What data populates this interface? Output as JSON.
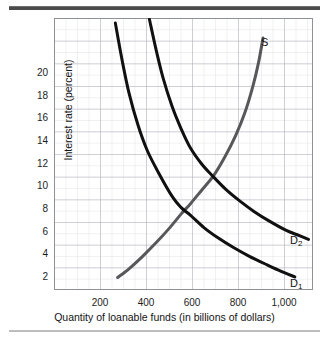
{
  "chart_data": {
    "type": "line",
    "title": "",
    "xlabel": "Quantity of loanable funds (in billions of dollars)",
    "ylabel": "Interest rate (percent)",
    "xlim": [
      0,
      1140
    ],
    "ylim": [
      0,
      21.8
    ],
    "grid": true,
    "grid_major_x": 200,
    "grid_minor_x": 50,
    "grid_major_y": 2,
    "grid_minor_y": 1,
    "legend": "inline-curve-labels",
    "xticks": [
      200,
      400,
      600,
      800,
      1000
    ],
    "xtick_labels": [
      "200",
      "400",
      "600",
      "800",
      "1,000"
    ],
    "yticks": [
      2,
      4,
      6,
      8,
      10,
      12,
      14,
      16,
      18,
      20
    ],
    "ytick_labels": [
      "2",
      "4",
      "6",
      "8",
      "10",
      "12",
      "14",
      "16",
      "18",
      "20"
    ],
    "series": [
      {
        "name": "S",
        "label": "S",
        "role": "supply",
        "color": "#58585a",
        "width": 3,
        "points": [
          [
            280,
            1.0
          ],
          [
            330,
            1.7
          ],
          [
            390,
            2.7
          ],
          [
            450,
            3.8
          ],
          [
            510,
            5.0
          ],
          [
            560,
            6.1
          ],
          [
            600,
            6.9
          ],
          [
            650,
            8.0
          ],
          [
            700,
            9.1
          ],
          [
            750,
            10.6
          ],
          [
            800,
            12.4
          ],
          [
            840,
            14.2
          ],
          [
            875,
            16.3
          ],
          [
            900,
            18.2
          ],
          [
            920,
            20.2
          ]
        ]
      },
      {
        "name": "D1",
        "label": "D",
        "sublabel": "1",
        "role": "demand-original",
        "color": "#101010",
        "width": 3,
        "points": [
          [
            270,
            21.4
          ],
          [
            300,
            18.4
          ],
          [
            330,
            15.8
          ],
          [
            370,
            13.2
          ],
          [
            410,
            11.2
          ],
          [
            460,
            9.4
          ],
          [
            520,
            7.5
          ],
          [
            560,
            6.6
          ],
          [
            600,
            6.0
          ],
          [
            660,
            5.0
          ],
          [
            720,
            4.2
          ],
          [
            790,
            3.4
          ],
          [
            860,
            2.7
          ],
          [
            940,
            2.0
          ],
          [
            1000,
            1.5
          ],
          [
            1060,
            1.05
          ]
        ]
      },
      {
        "name": "D2",
        "label": "D",
        "sublabel": "2",
        "role": "demand-increased",
        "color": "#101010",
        "width": 3,
        "points": [
          [
            420,
            21.7
          ],
          [
            450,
            19.2
          ],
          [
            480,
            17.0
          ],
          [
            520,
            14.7
          ],
          [
            560,
            12.9
          ],
          [
            600,
            11.4
          ],
          [
            650,
            10.1
          ],
          [
            700,
            9.1
          ],
          [
            760,
            8.0
          ],
          [
            820,
            7.1
          ],
          [
            880,
            6.3
          ],
          [
            950,
            5.5
          ],
          [
            1020,
            4.8
          ],
          [
            1080,
            4.35
          ],
          [
            1120,
            4.05
          ]
        ]
      }
    ],
    "intersections": [
      {
        "label": "D1 x S",
        "x": 600,
        "y": 6.0
      },
      {
        "label": "D2 x S",
        "x": 700,
        "y": 9.0
      }
    ]
  },
  "curve_labels": [
    {
      "name": "s-label",
      "text": "S",
      "sub": ""
    },
    {
      "name": "d2-label",
      "text": "D",
      "sub": "2"
    },
    {
      "name": "d1-label",
      "text": "D",
      "sub": "1"
    }
  ]
}
